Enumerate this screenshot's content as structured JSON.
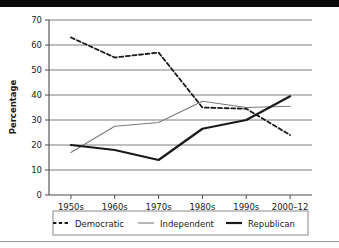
{
  "figure": {
    "background_color": "#ffffff",
    "top_band_color": "#0a0a0a",
    "rule_color": "#9a9a9a"
  },
  "chart_data": {
    "type": "line",
    "title": "",
    "xlabel": "",
    "ylabel": "Percentage",
    "categories": [
      "1950s",
      "1960s",
      "1970s",
      "1980s",
      "1990s",
      "2000–12"
    ],
    "ylim": [
      0,
      70
    ],
    "yticks": [
      0,
      10,
      20,
      30,
      40,
      50,
      60,
      70
    ],
    "ytick_labels": [
      "0",
      "10",
      "20",
      "30",
      "40",
      "50",
      "60",
      "70"
    ],
    "grid": true,
    "grid_axis": "y",
    "legend_position": "bottom",
    "series": [
      {
        "name": "Democratic",
        "style": "dashed",
        "color": "#1a1a1a",
        "width": 1.8,
        "values": [
          63,
          55,
          57,
          35,
          34.5,
          24
        ]
      },
      {
        "name": "Independent",
        "style": "solid-thin",
        "color": "#7a7a7a",
        "width": 1.1,
        "values": [
          17,
          27.5,
          29,
          37.5,
          35,
          35.5
        ]
      },
      {
        "name": "Republican",
        "style": "solid-thick",
        "color": "#1a1a1a",
        "width": 2.2,
        "values": [
          20,
          18,
          14,
          26.5,
          30,
          39.5
        ]
      }
    ]
  },
  "legend": {
    "items": [
      {
        "label": "Democratic",
        "swatch": "dashed"
      },
      {
        "label": "Independent",
        "swatch": "solid-thin"
      },
      {
        "label": "Republican",
        "swatch": "solid-thick"
      }
    ]
  }
}
